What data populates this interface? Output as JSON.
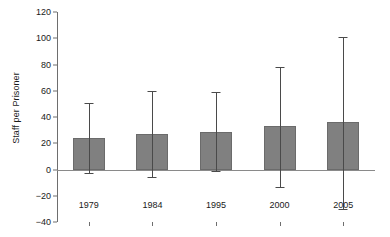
{
  "chart_data": {
    "type": "bar",
    "title": "",
    "xlabel": "",
    "ylabel": "Staff per Prisoner",
    "categories": [
      "1979",
      "1984",
      "1995",
      "2000",
      "2005"
    ],
    "values": [
      24,
      27,
      28.5,
      33,
      36
    ],
    "error_upper": [
      51,
      60,
      59,
      78,
      101
    ],
    "error_lower": [
      -3,
      -6,
      -1,
      -13,
      -30
    ],
    "ylim": [
      -40,
      120
    ],
    "ytick_labels": [
      "120",
      "100",
      "80",
      "60",
      "40",
      "20",
      "0",
      "-20",
      "-40"
    ],
    "ytick_values": [
      120,
      100,
      80,
      60,
      40,
      20,
      0,
      -20,
      -40
    ],
    "grid": false,
    "legend": "none",
    "bar_color": "#808080",
    "error_color": "#4a4a4a",
    "axis_color": "#6e6e6e"
  }
}
